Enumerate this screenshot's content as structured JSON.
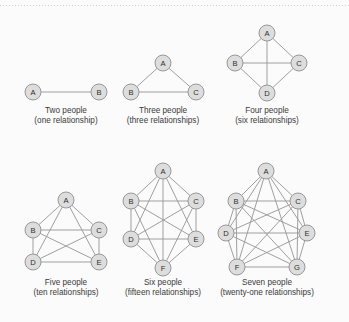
{
  "figure": {
    "title": "",
    "background_color": "#fbfbfb",
    "node_fill_color": "#dddddd",
    "node_stroke_color": "#8f8f8f",
    "edge_color": "#9a9a9a",
    "caption_color": "#3a3a3a",
    "top_rule": "dotted"
  },
  "chart_data": {
    "type": "diagram",
    "title": "",
    "graphs": [
      {
        "id": "two-people",
        "people": 2,
        "relationships": 1,
        "caption_line1": "Two people",
        "caption_line2": "(one relationship)",
        "nodes": [
          {
            "label": "A",
            "x": 33,
            "y": 92
          },
          {
            "label": "B",
            "x": 99,
            "y": 92
          }
        ],
        "edges": [
          [
            0,
            1
          ]
        ],
        "caption_x": 66,
        "caption_y": 113
      },
      {
        "id": "three-people",
        "people": 3,
        "relationships": 3,
        "caption_line1": "Three people",
        "caption_line2": "(three relationships)",
        "nodes": [
          {
            "label": "A",
            "x": 163,
            "y": 63
          },
          {
            "label": "B",
            "x": 131,
            "y": 92
          },
          {
            "label": "C",
            "x": 196,
            "y": 92
          }
        ],
        "edges": [
          [
            0,
            1
          ],
          [
            0,
            2
          ],
          [
            1,
            2
          ]
        ],
        "caption_x": 163,
        "caption_y": 113
      },
      {
        "id": "four-people",
        "people": 4,
        "relationships": 6,
        "caption_line1": "Four people",
        "caption_line2": "(six relationships)",
        "nodes": [
          {
            "label": "A",
            "x": 267,
            "y": 33
          },
          {
            "label": "B",
            "x": 235,
            "y": 63
          },
          {
            "label": "C",
            "x": 299,
            "y": 63
          },
          {
            "label": "D",
            "x": 267,
            "y": 93
          }
        ],
        "edges": [
          [
            0,
            1
          ],
          [
            0,
            2
          ],
          [
            0,
            3
          ],
          [
            1,
            2
          ],
          [
            1,
            3
          ],
          [
            2,
            3
          ]
        ],
        "caption_x": 267,
        "caption_y": 113
      },
      {
        "id": "five-people",
        "people": 5,
        "relationships": 10,
        "caption_line1": "Five people",
        "caption_line2": "(ten relationships)",
        "nodes": [
          {
            "label": "A",
            "x": 66,
            "y": 200
          },
          {
            "label": "B",
            "x": 33,
            "y": 230
          },
          {
            "label": "C",
            "x": 99,
            "y": 230
          },
          {
            "label": "D",
            "x": 33,
            "y": 262
          },
          {
            "label": "E",
            "x": 99,
            "y": 262
          }
        ],
        "edges": [
          [
            0,
            1
          ],
          [
            0,
            2
          ],
          [
            0,
            3
          ],
          [
            0,
            4
          ],
          [
            1,
            2
          ],
          [
            1,
            3
          ],
          [
            1,
            4
          ],
          [
            2,
            3
          ],
          [
            2,
            4
          ],
          [
            3,
            4
          ]
        ],
        "caption_x": 66,
        "caption_y": 285
      },
      {
        "id": "six-people",
        "people": 6,
        "relationships": 15,
        "caption_line1": "Six people",
        "caption_line2": "(fifteen relationships)",
        "nodes": [
          {
            "label": "A",
            "x": 163,
            "y": 171
          },
          {
            "label": "B",
            "x": 131,
            "y": 201
          },
          {
            "label": "C",
            "x": 196,
            "y": 201
          },
          {
            "label": "D",
            "x": 131,
            "y": 239
          },
          {
            "label": "E",
            "x": 196,
            "y": 239
          },
          {
            "label": "F",
            "x": 163,
            "y": 268
          }
        ],
        "edges": [
          [
            0,
            1
          ],
          [
            0,
            2
          ],
          [
            0,
            3
          ],
          [
            0,
            4
          ],
          [
            0,
            5
          ],
          [
            1,
            2
          ],
          [
            1,
            3
          ],
          [
            1,
            4
          ],
          [
            1,
            5
          ],
          [
            2,
            3
          ],
          [
            2,
            4
          ],
          [
            2,
            5
          ],
          [
            3,
            4
          ],
          [
            3,
            5
          ],
          [
            4,
            5
          ]
        ],
        "caption_x": 163,
        "caption_y": 285
      },
      {
        "id": "seven-people",
        "people": 7,
        "relationships": 21,
        "caption_line1": "Seven people",
        "caption_line2": "(twenty-one relationships)",
        "nodes": [
          {
            "label": "A",
            "x": 266,
            "y": 171
          },
          {
            "label": "B",
            "x": 236,
            "y": 201
          },
          {
            "label": "C",
            "x": 298,
            "y": 201
          },
          {
            "label": "D",
            "x": 226,
            "y": 233
          },
          {
            "label": "E",
            "x": 307,
            "y": 233
          },
          {
            "label": "F",
            "x": 237,
            "y": 267
          },
          {
            "label": "G",
            "x": 297,
            "y": 267
          }
        ],
        "edges": [
          [
            0,
            1
          ],
          [
            0,
            2
          ],
          [
            0,
            3
          ],
          [
            0,
            4
          ],
          [
            0,
            5
          ],
          [
            0,
            6
          ],
          [
            1,
            2
          ],
          [
            1,
            3
          ],
          [
            1,
            4
          ],
          [
            1,
            5
          ],
          [
            1,
            6
          ],
          [
            2,
            3
          ],
          [
            2,
            4
          ],
          [
            2,
            5
          ],
          [
            2,
            6
          ],
          [
            3,
            4
          ],
          [
            3,
            5
          ],
          [
            3,
            6
          ],
          [
            4,
            5
          ],
          [
            4,
            6
          ],
          [
            5,
            6
          ]
        ],
        "caption_x": 267,
        "caption_y": 285
      }
    ]
  }
}
